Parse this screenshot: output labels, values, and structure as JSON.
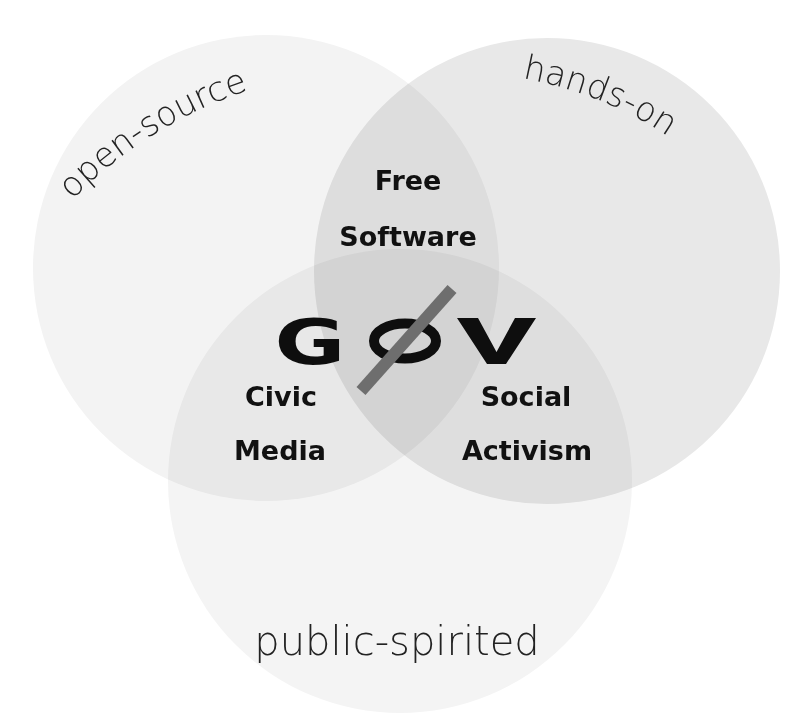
{
  "diagram": {
    "type": "venn",
    "center_logo": {
      "text": "GØV",
      "letters": [
        "G",
        "O",
        "V"
      ],
      "slash_color": "#6e6e6e",
      "letter_color": "#0e0e0e"
    },
    "sets": [
      {
        "id": "left",
        "label": "open-source",
        "fill": "#f3f3f3"
      },
      {
        "id": "right",
        "label": "hands-on",
        "fill": "#e8e8e8"
      },
      {
        "id": "bottom",
        "label": "public-spirited",
        "fill": "#f4f4f4"
      }
    ],
    "intersections": [
      {
        "sets": [
          "left",
          "right"
        ],
        "line1": "Free",
        "line2": "Software"
      },
      {
        "sets": [
          "left",
          "bottom"
        ],
        "line1": "Civic",
        "line2": "Media"
      },
      {
        "sets": [
          "right",
          "bottom"
        ],
        "line1": "Social",
        "line2": "Activism"
      }
    ]
  }
}
